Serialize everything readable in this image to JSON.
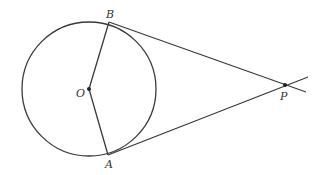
{
  "diagram": {
    "labels": {
      "B": "B",
      "O": "O",
      "A": "A",
      "P": "P"
    },
    "points": {
      "O": [
        89,
        89
      ],
      "B": [
        109,
        22
      ],
      "A": [
        108,
        155
      ],
      "P": [
        285,
        85
      ]
    },
    "circle": {
      "cx": 89,
      "cy": 89,
      "r": 67
    },
    "stroke_color": "#3a3a3a"
  }
}
